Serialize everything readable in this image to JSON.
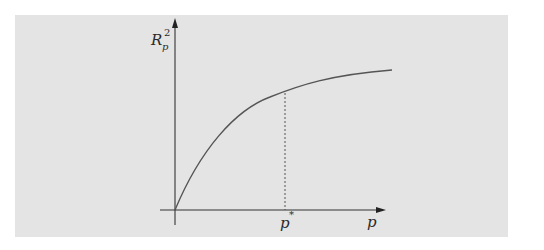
{
  "diagram": {
    "type": "concave saturating curve",
    "y_axis_label": {
      "base": "R",
      "subscript": "p",
      "superscript": "2"
    },
    "x_axis_label": "p",
    "marker_label": {
      "base": "p",
      "superscript": "*"
    },
    "colors": {
      "panel": "#e4e4e4",
      "axes": "#333333",
      "curve": "#555555",
      "dashed": "#444444"
    }
  }
}
